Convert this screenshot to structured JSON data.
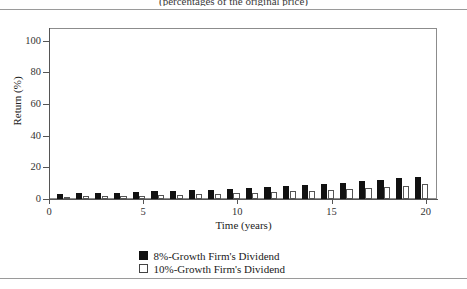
{
  "caption": "(percentages of the original price)",
  "legend": {
    "items": [
      {
        "label": "8%-Growth Firm's Dividend",
        "swatch": "black",
        "color": "#111111"
      },
      {
        "label": "10%-Growth Firm's Dividend",
        "swatch": "white",
        "color": "#ffffff"
      }
    ]
  },
  "chart_data": {
    "type": "bar",
    "title": "(percentages of the original price)",
    "xlabel": "Time (years)",
    "ylabel": "Return (%)",
    "xlim": [
      0,
      20.6
    ],
    "ylim": [
      0,
      108
    ],
    "grid": false,
    "legend_position": "bottom",
    "xticks": [
      0,
      5,
      10,
      15,
      20
    ],
    "xtick_labels": [
      "0",
      "5",
      "10",
      "15",
      "20"
    ],
    "yticks": [
      0,
      20,
      40,
      60,
      80,
      100
    ],
    "ytick_labels": [
      "0",
      "20",
      "40",
      "60",
      "80",
      "100"
    ],
    "categories": [
      1,
      2,
      3,
      4,
      5,
      6,
      7,
      8,
      9,
      10,
      11,
      12,
      13,
      14,
      15,
      16,
      17,
      18,
      19,
      20
    ],
    "series": [
      {
        "name": "8%-Growth Firm's Dividend",
        "color": "#111111",
        "values": [
          3.2,
          3.5,
          3.8,
          4.1,
          4.4,
          4.8,
          5.2,
          5.6,
          6.0,
          6.5,
          7.0,
          7.6,
          8.2,
          8.8,
          9.5,
          10.3,
          11.1,
          12.0,
          13.0,
          14.0
        ]
      },
      {
        "name": "10%-Growth Firm's Dividend",
        "color": "#ffffff",
        "values": [
          1.5,
          1.7,
          1.8,
          2.0,
          2.2,
          2.4,
          2.7,
          2.9,
          3.2,
          3.6,
          3.9,
          4.3,
          4.8,
          5.3,
          5.8,
          6.4,
          7.0,
          7.7,
          8.5,
          9.4
        ]
      }
    ]
  }
}
